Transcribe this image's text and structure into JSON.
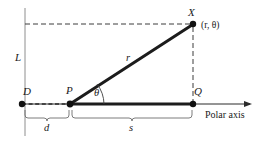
{
  "figure": {
    "background_color": "#ffffff",
    "stroke_color": "#2b2b2b",
    "dash_color": "#4a4a4a",
    "label_color": "#1a1a1a",
    "labels": {
      "directrix": "L",
      "point_d": "D",
      "point_p": "P",
      "point_q": "Q",
      "point_x": "X",
      "coordinates": "(r, θ)",
      "radius": "r",
      "angle": "θ",
      "distance_d": "d",
      "distance_s": "s",
      "axis": "Polar axis"
    },
    "geometry": {
      "point_d": {
        "x": 22,
        "y": 104
      },
      "point_p": {
        "x": 70,
        "y": 104
      },
      "point_q": {
        "x": 193,
        "y": 104
      },
      "point_x": {
        "x": 193,
        "y": 24
      },
      "directrix_x": 25,
      "directrix_top_y": 8,
      "directrix_bottom_y": 136,
      "axis_arrow_x": 252,
      "brace_d_left": 25,
      "brace_d_right": 70,
      "brace_s_left": 72,
      "brace_s_right": 193,
      "brace_y": 110,
      "angle_arc_radius": 30
    }
  }
}
